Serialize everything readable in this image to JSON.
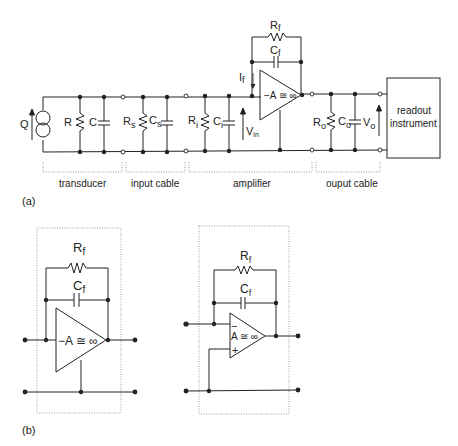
{
  "figure_a": {
    "panel_label": "(a)",
    "source": {
      "label": "Q"
    },
    "transducer": {
      "R": "R",
      "C": "C",
      "section_label": "transducer"
    },
    "input_cable": {
      "R": "R",
      "R_sub": "s",
      "C": "C",
      "C_sub": "s",
      "section_label": "input cable"
    },
    "amplifier": {
      "R": "R",
      "R_sub": "i",
      "C": "C",
      "C_sub": "i",
      "V": "V",
      "V_sub": "in",
      "I": "I",
      "I_sub": "f",
      "Rf": "R",
      "Rf_sub": "f",
      "Cf": "C",
      "Cf_sub": "f",
      "gain": "−A ≅ ∞",
      "section_label": "amplifier"
    },
    "output_cable": {
      "R": "R",
      "R_sub": "o",
      "C": "C",
      "C_sub": "o",
      "V": "V",
      "V_sub": "o",
      "section_label": "ouput cable"
    },
    "readout": {
      "line1": "readout",
      "line2": "instrument"
    }
  },
  "figure_b": {
    "panel_label": "(b)",
    "left": {
      "Rf": "R",
      "Rf_sub": "f",
      "Cf": "C",
      "Cf_sub": "f",
      "gain": "−A ≅ ∞"
    },
    "right": {
      "Rf": "R",
      "Rf_sub": "f",
      "Cf": "C",
      "Cf_sub": "f",
      "gain": "A ≅ ∞",
      "minus": "−",
      "plus": "+"
    }
  }
}
